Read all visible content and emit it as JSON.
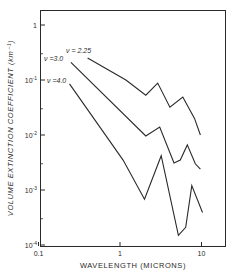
{
  "chart_data": {
    "type": "line",
    "title": "",
    "xlabel": "WAVELENGTH (MICRONS)",
    "ylabel": "VOLUME EXTINCTION COEFFICIENT (km⁻¹)",
    "xscale": "log",
    "yscale": "log",
    "xlim": [
      0.1,
      20
    ],
    "ylim": [
      0.0001,
      3
    ],
    "grid": false,
    "legend_position": "inline labels at line starts",
    "x_ticks": [
      {
        "value": 0.1,
        "label": "0.1"
      },
      {
        "value": 1,
        "label": "1"
      },
      {
        "value": 10,
        "label": "10"
      }
    ],
    "y_ticks": [
      {
        "value": 1,
        "label": "1",
        "base": "1",
        "exp": ""
      },
      {
        "value": 0.1,
        "label": "10⁻¹",
        "base": "10",
        "exp": "-1"
      },
      {
        "value": 0.01,
        "label": "10⁻²",
        "base": "10",
        "exp": "-2"
      },
      {
        "value": 0.001,
        "label": "10⁻³",
        "base": "10",
        "exp": "-3"
      },
      {
        "value": 0.0001,
        "label": "10⁻⁴",
        "base": "10",
        "exp": "-4"
      }
    ],
    "y_minor_ticks": [
      0.3,
      0.03,
      0.003,
      0.0003
    ],
    "series": [
      {
        "name": "ν = 2.25",
        "label": "ν = 2.25",
        "x": [
          0.4,
          1.18,
          2.07,
          2.9,
          4.1,
          5.9,
          8.2,
          9.7
        ],
        "y": [
          0.25,
          0.1,
          0.053,
          0.088,
          0.032,
          0.049,
          0.02,
          0.01
        ]
      },
      {
        "name": "ν = 3.0",
        "label": "ν =3.0",
        "x": [
          0.25,
          2.07,
          3.07,
          4.6,
          5.5,
          6.7,
          8.4,
          9.7
        ],
        "y": [
          0.21,
          0.0096,
          0.014,
          0.0031,
          0.0035,
          0.0066,
          0.003,
          0.0024
        ]
      },
      {
        "name": "ν = 4.0",
        "label": "ν =4.0",
        "x": [
          0.24,
          1.09,
          2.0,
          3.2,
          5.2,
          6.4,
          7.6,
          10.3
        ],
        "y": [
          0.085,
          0.0035,
          0.00068,
          0.0042,
          0.00015,
          0.00021,
          0.0012,
          0.00039
        ]
      }
    ],
    "colors": {
      "line": "#2a2a2a",
      "axis": "#2a2a2a",
      "background": "#ffffff"
    }
  }
}
